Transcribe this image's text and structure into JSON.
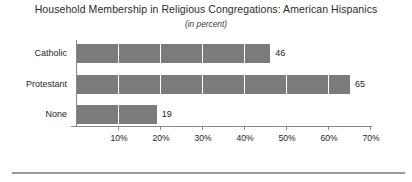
{
  "chart_data": {
    "type": "bar",
    "orientation": "horizontal",
    "title": "Household Membership in Religious Congregations: American Hispanics",
    "subtitle": "(in percent)",
    "categories": [
      "Catholic",
      "Protestant",
      "None"
    ],
    "values": [
      46,
      65,
      19
    ],
    "value_labels": [
      "46",
      "65",
      "19"
    ],
    "xlabel": "",
    "ylabel": "",
    "xlim": [
      0,
      70
    ],
    "xticks": [
      10,
      20,
      30,
      40,
      50,
      60,
      70
    ],
    "xtick_labels": [
      "10%",
      "20%",
      "30%",
      "40%",
      "50%",
      "60%",
      "70%"
    ],
    "grid": "vertical-white-over-bars",
    "legend": "none",
    "bar_color": "#7b7b7b",
    "axis_color": "#8a8a8a",
    "text_color": "#231f20",
    "background": "#ffffff",
    "footer_rule_color": "#9a9a9a"
  }
}
